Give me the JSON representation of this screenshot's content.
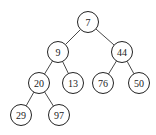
{
  "diagram": {
    "type": "binary-tree",
    "nodes": [
      {
        "id": "n7",
        "label": "7",
        "x": 88,
        "y": 22
      },
      {
        "id": "n9",
        "label": "9",
        "x": 58,
        "y": 52
      },
      {
        "id": "n44",
        "label": "44",
        "x": 122,
        "y": 52
      },
      {
        "id": "n20",
        "label": "20",
        "x": 39,
        "y": 83
      },
      {
        "id": "n13",
        "label": "13",
        "x": 73,
        "y": 83
      },
      {
        "id": "n76",
        "label": "76",
        "x": 103,
        "y": 83
      },
      {
        "id": "n50",
        "label": "50",
        "x": 139,
        "y": 83
      },
      {
        "id": "n29",
        "label": "29",
        "x": 21,
        "y": 115
      },
      {
        "id": "n97",
        "label": "97",
        "x": 59,
        "y": 115
      }
    ],
    "edges": [
      [
        "n7",
        "n9"
      ],
      [
        "n7",
        "n44"
      ],
      [
        "n9",
        "n20"
      ],
      [
        "n9",
        "n13"
      ],
      [
        "n44",
        "n76"
      ],
      [
        "n44",
        "n50"
      ],
      [
        "n20",
        "n29"
      ],
      [
        "n20",
        "n97"
      ]
    ],
    "node_radius": 10.5,
    "colors": {
      "stroke": "#222222",
      "fill": "#ffffff",
      "edge": "#333333"
    }
  }
}
